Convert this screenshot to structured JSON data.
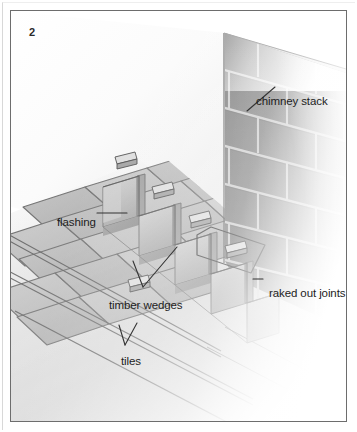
{
  "figure": {
    "number": "2"
  },
  "callouts": [
    {
      "id": "chimney-stack",
      "label": "chimney stack",
      "x": 245,
      "y": 84
    },
    {
      "id": "flashing",
      "label": "flashing",
      "x": 46,
      "y": 205
    },
    {
      "id": "timber-wedges",
      "label": "timber wedges",
      "x": 98,
      "y": 288
    },
    {
      "id": "tiles",
      "label": "tiles",
      "x": 110,
      "y": 344
    },
    {
      "id": "raked-out-joints",
      "label": "raked out joints",
      "x": 258,
      "y": 276
    }
  ],
  "colors": {
    "page_background": "#ffffff",
    "frame_border": "#6d6d6d",
    "outer_rule": "#d8d8d8",
    "brick_face_dark": "#7e7e7e",
    "brick_face_mid": "#8c8c8c",
    "brick_face_light": "#a0a0a0",
    "mortar_joint": "#c9c9c9",
    "wall_top_highlight": "#e9e9e9",
    "tile_face": "#b4b4b4",
    "tile_face_light": "#c4c4c4",
    "tile_edge": "#6a6a6a",
    "flashing_face": "#b9b9b9",
    "flashing_shadow": "#8f8f8f",
    "wedge_face": "#d2d2d2",
    "wedge_edge": "#4a4a4a",
    "leader_line": "#3a3a3a",
    "text": "#1d1d1d"
  },
  "geometry": {
    "brick_courses": 7,
    "tile_rows": 4,
    "timber_wedges_visible": 5,
    "flashing_steps": 5
  }
}
